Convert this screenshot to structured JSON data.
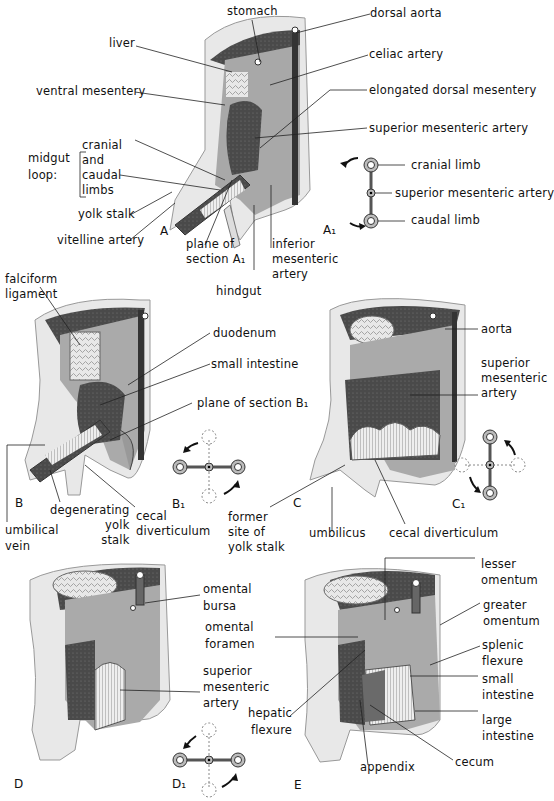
{
  "figure": {
    "panels": {
      "A": {
        "letter": "A",
        "labels": {
          "stomach": "stomach",
          "liver": "liver",
          "dorsal_aorta": "dorsal aorta",
          "celiac_artery": "celiac artery",
          "ventral_mesentery": "ventral mesentery",
          "elongated_dorsal_mesentery": "elongated dorsal mesentery",
          "superior_mesenteric_artery": "superior mesenteric artery",
          "midgut_loop": "midgut\nloop:",
          "cranial_and_caudal_limbs": "cranial\nand\ncaudal\nlimbs",
          "yolk_stalk": "yolk stalk",
          "vitelline_artery": "vitelline artery",
          "plane_of_section": "plane of\nsection A₁",
          "inferior_mesenteric_artery": "inferior\nmesenteric\nartery",
          "hindgut": "hindgut"
        }
      },
      "A1": {
        "letter": "A₁",
        "labels": {
          "cranial_limb": "cranial limb",
          "superior_mesenteric_artery": "superior mesenteric artery",
          "caudal_limb": "caudal limb"
        }
      },
      "B": {
        "letter": "B",
        "labels": {
          "falciform_ligament": "falciform\nligament",
          "duodenum": "duodenum",
          "small_intestine": "small intestine",
          "plane_of_section": "plane of section B₁",
          "umbilical_vein": "umbilical\nvein",
          "degenerating_yolk_stalk": "degenerating\nyolk\nstalk",
          "cecal_diverticulum": "cecal\ndiverticulum"
        }
      },
      "B1": {
        "letter": "B₁"
      },
      "C": {
        "letter": "C",
        "labels": {
          "aorta": "aorta",
          "superior_mesenteric_artery": "superior\nmesenteric\nartery",
          "former_site_of_yolk_stalk": "former\nsite of\nyolk stalk",
          "umbilicus": "umbilicus",
          "cecal_diverticulum": "cecal diverticulum"
        }
      },
      "C1": {
        "letter": "C₁"
      },
      "D": {
        "letter": "D",
        "labels": {
          "omental_bursa": "omental\nbursa",
          "superior_mesenteric_artery": "superior\nmesenteric\nartery"
        }
      },
      "D1": {
        "letter": "D₁"
      },
      "E": {
        "letter": "E",
        "labels": {
          "lesser_omentum": "lesser\nomentum",
          "greater_omentum": "greater\nomentum",
          "omental_foramen": "omental\nforamen",
          "splenic_flexure": "splenic\nflexure",
          "small_intestine": "small\nintestine",
          "hepatic_flexure": "hepatic\nflexure",
          "large_intestine": "large\nintestine",
          "appendix": "appendix",
          "cecum": "cecum"
        }
      }
    },
    "colors": {
      "body_wall": "#e6e6e6",
      "cavity_dark": "#3a3a3a",
      "organ_mid": "#9a9a9a",
      "organ_light": "#cfcfcf",
      "line": "#222222"
    }
  }
}
